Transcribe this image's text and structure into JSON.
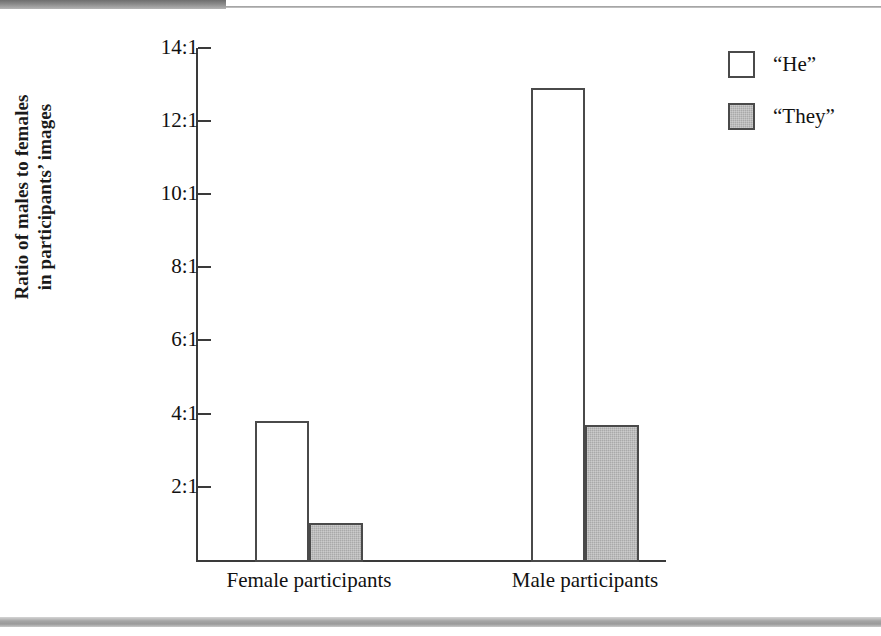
{
  "chart_data": {
    "type": "bar",
    "title": "",
    "xlabel": "",
    "ylabel": "Ratio of males to females in participants' images",
    "categories": [
      "Female participants",
      "Male participants"
    ],
    "series": [
      {
        "name": "“He”",
        "values": [
          3.8,
          12.9
        ],
        "color": "#ffffff"
      },
      {
        "name": "“They”",
        "values": [
          1.0,
          3.7
        ],
        "color": "#a9a9a9"
      }
    ],
    "ytick_labels": [
      "14:1",
      "12:1",
      "10:1",
      "8:1",
      "6:1",
      "4:1",
      "2:1"
    ],
    "ytick_values": [
      14,
      12,
      10,
      8,
      6,
      4,
      2
    ],
    "ylim": [
      0,
      14.35
    ],
    "grid": false,
    "legend_position": "top-right"
  },
  "axes": {
    "y_title": "Ratio of males to females in participants’ images",
    "y_title_line1": "Ratio of males to females",
    "y_title_line2": "in participants’ images"
  },
  "legend": {
    "items": [
      {
        "label": "“He”",
        "swatch": "white-square"
      },
      {
        "label": "“They”",
        "swatch": "gray-square"
      }
    ]
  },
  "colors": {
    "bar_he_fill": "#ffffff",
    "bar_they_fill": "#a9a9a9",
    "bar_outline": "#4a4a4a",
    "axis": "#3a3a3a",
    "text": "#111111"
  }
}
